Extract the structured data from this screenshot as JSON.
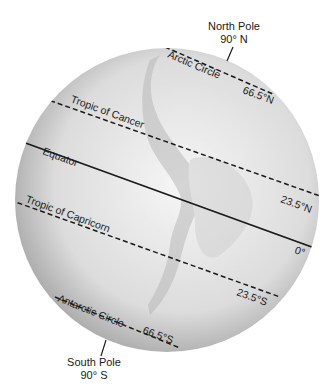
{
  "diagram": {
    "poles": {
      "north": {
        "name": "North Pole",
        "latitude": "90° N"
      },
      "south": {
        "name": "South Pole",
        "latitude": "90° S"
      }
    },
    "lines": [
      {
        "name": "Arctic Circle",
        "latitude": "66.5°N",
        "style": "dashed"
      },
      {
        "name": "Tropic of Cancer",
        "latitude": "23.5°N",
        "style": "dashed"
      },
      {
        "name": "Equator",
        "latitude": "0°",
        "style": "solid"
      },
      {
        "name": "Tropic of Capricorn",
        "latitude": "23.5°S",
        "style": "dashed"
      },
      {
        "name": "Antarctic Circle",
        "latitude": "66.5°S",
        "style": "dashed"
      }
    ],
    "colors": {
      "line": "#1a1a1a",
      "globe_light": "#f4f4f4",
      "globe_dark": "#9a9a9a"
    }
  }
}
